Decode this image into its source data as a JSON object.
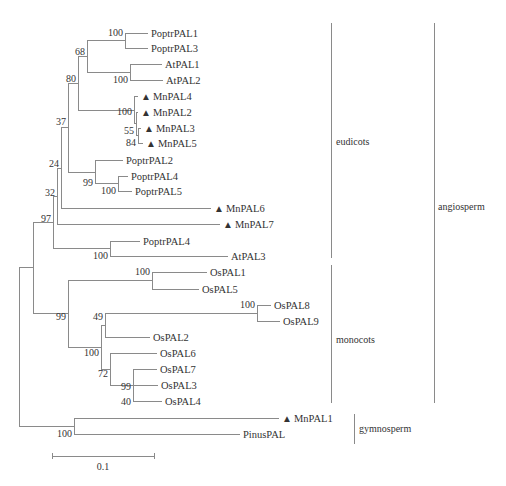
{
  "figure": {
    "type": "phylogenetic-tree",
    "marker_symbol": "▲",
    "caption": "",
    "line_color": "#8a8a8a",
    "text_color": "#333333"
  },
  "leaves": [
    {
      "id": "PoptrPAL1",
      "label": "PoptrPAL1",
      "marked": false,
      "y": 33,
      "tip_x": 148
    },
    {
      "id": "PoptrPAL3",
      "label": "PoptrPAL3",
      "marked": false,
      "y": 48,
      "tip_x": 148
    },
    {
      "id": "AtPAL1",
      "label": "AtPAL1",
      "marked": false,
      "y": 64,
      "tip_x": 162
    },
    {
      "id": "AtPAL2",
      "label": "AtPAL2",
      "marked": false,
      "y": 80,
      "tip_x": 163
    },
    {
      "id": "MnPAL4",
      "label": "MnPAL4",
      "marked": true,
      "y": 96,
      "tip_x": 138
    },
    {
      "id": "MnPAL2",
      "label": "MnPAL2",
      "marked": true,
      "y": 112,
      "tip_x": 138
    },
    {
      "id": "MnPAL3",
      "label": "MnPAL3",
      "marked": true,
      "y": 128,
      "tip_x": 141
    },
    {
      "id": "MnPAL5",
      "label": "MnPAL5",
      "marked": true,
      "y": 143,
      "tip_x": 143
    },
    {
      "id": "PoptrPAL2",
      "label": "PoptrPAL2",
      "marked": false,
      "y": 160,
      "tip_x": 123
    },
    {
      "id": "PoptrPAL4a",
      "label": "PoptrPAL4",
      "marked": false,
      "y": 176,
      "tip_x": 128
    },
    {
      "id": "PoptrPAL5",
      "label": "PoptrPAL5",
      "marked": false,
      "y": 191,
      "tip_x": 132
    },
    {
      "id": "MnPAL6",
      "label": "MnPAL6",
      "marked": true,
      "y": 208,
      "tip_x": 211
    },
    {
      "id": "MnPAL7",
      "label": "MnPAL7",
      "marked": true,
      "y": 224,
      "tip_x": 220
    },
    {
      "id": "PoptrPAL4b",
      "label": "PoptrPAL4",
      "marked": false,
      "y": 241,
      "tip_x": 140
    },
    {
      "id": "AtPAL3",
      "label": "AtPAL3",
      "marked": false,
      "y": 256,
      "tip_x": 228
    },
    {
      "id": "OsPAL1",
      "label": "OsPAL1",
      "marked": false,
      "y": 272,
      "tip_x": 207
    },
    {
      "id": "OsPAL5",
      "label": "OsPAL5",
      "marked": false,
      "y": 289,
      "tip_x": 199
    },
    {
      "id": "OsPAL8",
      "label": "OsPAL8",
      "marked": false,
      "y": 305,
      "tip_x": 271
    },
    {
      "id": "OsPAL9",
      "label": "OsPAL9",
      "marked": false,
      "y": 321,
      "tip_x": 280
    },
    {
      "id": "OsPAL2",
      "label": "OsPAL2",
      "marked": false,
      "y": 337,
      "tip_x": 150
    },
    {
      "id": "OsPAL6",
      "label": "OsPAL6",
      "marked": false,
      "y": 353,
      "tip_x": 157
    },
    {
      "id": "OsPAL7",
      "label": "OsPAL7",
      "marked": false,
      "y": 369,
      "tip_x": 157
    },
    {
      "id": "OsPAL3",
      "label": "OsPAL3",
      "marked": false,
      "y": 385,
      "tip_x": 158
    },
    {
      "id": "OsPAL4",
      "label": "OsPAL4",
      "marked": false,
      "y": 401,
      "tip_x": 162
    },
    {
      "id": "MnPAL1",
      "label": "MnPAL1",
      "marked": true,
      "y": 418,
      "tip_x": 279
    },
    {
      "id": "PinusPAL",
      "label": "PinusPAL",
      "marked": false,
      "y": 434,
      "tip_x": 240
    }
  ],
  "nodes": [
    {
      "id": "n_poptr13",
      "x": 125,
      "y_top": 33,
      "y_bot": 48,
      "bootstrap": "100",
      "parent_x": 87
    },
    {
      "id": "n_at12",
      "x": 130,
      "y_top": 64,
      "y_bot": 80,
      "bootstrap": "100",
      "parent_x": 87
    },
    {
      "id": "n_68",
      "x": 87,
      "y_top": 40,
      "y_bot": 72,
      "bootstrap": "68",
      "parent_x": 78
    },
    {
      "id": "n_mn35",
      "x": 138,
      "y_top": 128,
      "y_bot": 143,
      "bootstrap": "84",
      "parent_x": 136
    },
    {
      "id": "n_55",
      "x": 136,
      "y_top": 112,
      "y_bot": 135,
      "bootstrap": "55",
      "parent_x": 134
    },
    {
      "id": "n_mn100",
      "x": 134,
      "y_top": 96,
      "y_bot": 124,
      "bootstrap": "100",
      "parent_x": 78
    },
    {
      "id": "n_80",
      "x": 78,
      "y_top": 56,
      "y_bot": 110,
      "bootstrap": "80",
      "parent_x": 68
    },
    {
      "id": "n_poptr45",
      "x": 118,
      "y_top": 176,
      "y_bot": 191,
      "bootstrap": "100",
      "parent_x": 95
    },
    {
      "id": "n_99a",
      "x": 95,
      "y_top": 160,
      "y_bot": 184,
      "bootstrap": "99",
      "parent_x": 68
    },
    {
      "id": "n_37",
      "x": 68,
      "y_top": 83,
      "y_bot": 172,
      "bootstrap": "37",
      "parent_x": 61
    },
    {
      "id": "n_24",
      "x": 61,
      "y_top": 128,
      "y_bot": 208,
      "bootstrap": "24",
      "parent_x": 57
    },
    {
      "id": "n_32",
      "x": 57,
      "y_top": 168,
      "y_bot": 224,
      "bootstrap": "32",
      "parent_x": 53
    },
    {
      "id": "n_poptrAt3",
      "x": 110,
      "y_top": 241,
      "y_bot": 256,
      "bootstrap": "100",
      "parent_x": 53
    },
    {
      "id": "n_97",
      "x": 53,
      "y_top": 196,
      "y_bot": 248,
      "bootstrap": "97",
      "parent_x": 33
    },
    {
      "id": "n_os15",
      "x": 152,
      "y_top": 272,
      "y_bot": 289,
      "bootstrap": "100",
      "parent_x": 68
    },
    {
      "id": "n_os89",
      "x": 257,
      "y_top": 305,
      "y_bot": 321,
      "bootstrap": "100",
      "parent_x": 105
    },
    {
      "id": "n_49",
      "x": 105,
      "y_top": 313,
      "y_bot": 337,
      "bootstrap": "49",
      "parent_x": 101
    },
    {
      "id": "n_os734",
      "x": 133,
      "y_top": 369,
      "y_bot": 401,
      "bootstrap": "99",
      "parent_x": 110
    },
    {
      "id": "n_40",
      "x": 133,
      "y_top": 385,
      "y_bot": 401,
      "bootstrap": "40",
      "parent_x": 133
    },
    {
      "id": "n_72",
      "x": 110,
      "y_top": 353,
      "y_bot": 385,
      "bootstrap": "72",
      "parent_x": 101
    },
    {
      "id": "n_100os",
      "x": 101,
      "y_top": 325,
      "y_bot": 369,
      "bootstrap": "100",
      "parent_x": 68
    },
    {
      "id": "n_99b",
      "x": 68,
      "y_top": 280,
      "y_bot": 347,
      "bootstrap": "99",
      "parent_x": 33
    },
    {
      "id": "n_angio",
      "x": 33,
      "y_top": 222,
      "y_bot": 313,
      "bootstrap": "",
      "parent_x": 19
    },
    {
      "id": "n_gymno",
      "x": 74,
      "y_top": 418,
      "y_bot": 434,
      "bootstrap": "100",
      "parent_x": 19
    },
    {
      "id": "n_root",
      "x": 19,
      "y_top": 267,
      "y_bot": 426,
      "bootstrap": "",
      "parent_x": 19
    }
  ],
  "bootstrap_labels": [
    {
      "text": "100",
      "x": 124,
      "y": 36
    },
    {
      "text": "68",
      "x": 86,
      "y": 55
    },
    {
      "text": "100",
      "x": 129,
      "y": 83
    },
    {
      "text": "80",
      "x": 77,
      "y": 82
    },
    {
      "text": "100",
      "x": 133,
      "y": 115
    },
    {
      "text": "55",
      "x": 135,
      "y": 134
    },
    {
      "text": "84",
      "x": 137,
      "y": 146
    },
    {
      "text": "37",
      "x": 67,
      "y": 125
    },
    {
      "text": "99",
      "x": 94,
      "y": 186
    },
    {
      "text": "100",
      "x": 117,
      "y": 194
    },
    {
      "text": "24",
      "x": 60,
      "y": 167
    },
    {
      "text": "32",
      "x": 56,
      "y": 196
    },
    {
      "text": "97",
      "x": 52,
      "y": 222
    },
    {
      "text": "100",
      "x": 109,
      "y": 259
    },
    {
      "text": "100",
      "x": 151,
      "y": 275
    },
    {
      "text": "100",
      "x": 256,
      "y": 308
    },
    {
      "text": "99",
      "x": 67,
      "y": 320
    },
    {
      "text": "49",
      "x": 104,
      "y": 320
    },
    {
      "text": "100",
      "x": 100,
      "y": 356
    },
    {
      "text": "72",
      "x": 109,
      "y": 377
    },
    {
      "text": "99",
      "x": 132,
      "y": 390
    },
    {
      "text": "40",
      "x": 132,
      "y": 405
    },
    {
      "text": "100",
      "x": 73,
      "y": 437
    }
  ],
  "clades": [
    {
      "id": "eudicots",
      "label": "eudicots",
      "bar_x": 331,
      "y_top": 23,
      "y_bot": 258,
      "label_x": 336,
      "label_y": 145
    },
    {
      "id": "monocots",
      "label": "monocots",
      "bar_x": 331,
      "y_top": 265,
      "y_bot": 403,
      "label_x": 336,
      "label_y": 343
    },
    {
      "id": "angiosperm",
      "label": "angiosperm",
      "bar_x": 434,
      "y_top": 23,
      "y_bot": 403,
      "label_x": 438,
      "label_y": 210
    },
    {
      "id": "gymnosperm",
      "label": "gymnosperm",
      "bar_x": 354,
      "y_top": 414,
      "y_bot": 444,
      "label_x": 359,
      "label_y": 432
    }
  ],
  "scale_bar": {
    "label": "0.1",
    "x1": 52,
    "x2": 154,
    "y": 456,
    "label_x": 103,
    "label_y": 470
  },
  "chart_data": {
    "type": "phylogenetic-tree",
    "title": "",
    "scale": "0.1",
    "clades": {
      "angiosperm": {
        "eudicots": [
          "PoptrPAL1",
          "PoptrPAL3",
          "AtPAL1",
          "AtPAL2",
          "MnPAL4",
          "MnPAL2",
          "MnPAL3",
          "MnPAL5",
          "PoptrPAL2",
          "PoptrPAL4",
          "PoptrPAL5",
          "MnPAL6",
          "MnPAL7",
          "PoptrPAL4",
          "AtPAL3"
        ],
        "monocots": [
          "OsPAL1",
          "OsPAL5",
          "OsPAL8",
          "OsPAL9",
          "OsPAL2",
          "OsPAL6",
          "OsPAL7",
          "OsPAL3",
          "OsPAL4"
        ]
      },
      "gymnosperm": [
        "MnPAL1",
        "PinusPAL"
      ]
    },
    "newick": "(((((((((PoptrPAL1,PoptrPAL3)100,(AtPAL1,AtPAL2)100)68,(MnPAL4,(MnPAL2,(MnPAL3,MnPAL5)84)55)100)80,(PoptrPAL2,(PoptrPAL4,PoptrPAL5)100)99)37,MnPAL6)24,MnPAL7)32,(PoptrPAL4,AtPAL3)100)97,((OsPAL1,OsPAL5)100,(((OsPAL8,OsPAL9)100,OsPAL2)49,(OsPAL6,(OsPAL7,(OsPAL3,OsPAL4)40)99)72)100)99),(MnPAL1,PinusPAL)100);",
    "marked_leaves": [
      "MnPAL1",
      "MnPAL2",
      "MnPAL3",
      "MnPAL4",
      "MnPAL5",
      "MnPAL6",
      "MnPAL7"
    ]
  }
}
